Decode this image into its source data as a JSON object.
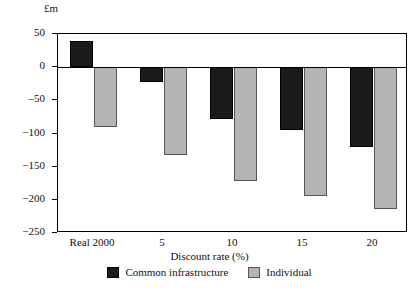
{
  "chart_data": {
    "type": "bar",
    "title": "",
    "unit_label": "£m",
    "xlabel": "Discount rate (%)",
    "ylabel": "",
    "categories": [
      "Real 2000",
      "5",
      "10",
      "15",
      "20"
    ],
    "series": [
      {
        "name": "Common infrastructure",
        "color": "#1a1a1a",
        "values": [
          40,
          -23,
          -78,
          -95,
          -120
        ]
      },
      {
        "name": "Individual",
        "color": "#b4b4b4",
        "values": [
          -90,
          -132,
          -172,
          -194,
          -214
        ]
      }
    ],
    "ylim": [
      -250,
      50
    ],
    "yticks": [
      50,
      0,
      -50,
      -100,
      -150,
      -200,
      -250
    ],
    "ytick_labels": [
      "50",
      "0",
      "‒50",
      "−100",
      "−150",
      "−200",
      "−250"
    ],
    "grid": false,
    "legend_position": "bottom"
  }
}
